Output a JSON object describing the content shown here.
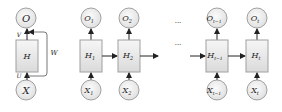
{
  "diagram": {
    "folded": {
      "output": "O",
      "hidden": "H",
      "input": "X",
      "weight_out": "V",
      "weight_in": "U",
      "weight_recurrent": "W"
    },
    "unrolled": [
      {
        "output": "O",
        "output_sub": "1",
        "hidden": "H",
        "hidden_sub": "1",
        "input": "X",
        "input_sub": "1"
      },
      {
        "output": "O",
        "output_sub": "2",
        "hidden": "H",
        "hidden_sub": "2",
        "input": "X",
        "input_sub": "2"
      },
      {
        "output": "O",
        "output_sub": "t−1",
        "hidden": "H",
        "hidden_sub": "t−1",
        "input": "X",
        "input_sub": "t−1"
      },
      {
        "output": "O",
        "output_sub": "t",
        "hidden": "H",
        "hidden_sub": "t",
        "input": "X",
        "input_sub": "t"
      }
    ],
    "ellipsis": "···",
    "colors": {
      "node_fill": "#e9e9e9",
      "node_stroke": "#9a9a9a",
      "box_fill_top": "#f4f4f4",
      "box_fill_bottom": "#dcdcdc",
      "arrow": "#222222"
    }
  }
}
